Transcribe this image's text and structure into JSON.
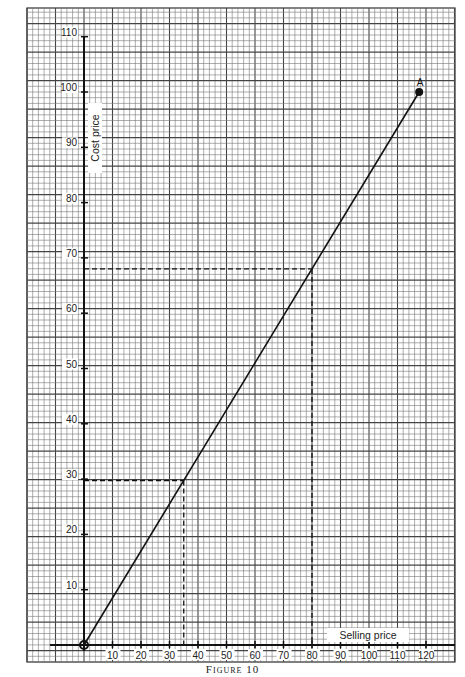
{
  "caption": "Figure 10",
  "chart_data": {
    "type": "line",
    "title": "",
    "xlabel": "Selling price",
    "ylabel": "Cost price",
    "xlim": [
      0,
      120
    ],
    "ylim": [
      0,
      110
    ],
    "x_ticks": [
      10,
      20,
      30,
      40,
      50,
      60,
      70,
      80,
      90,
      100,
      110,
      120
    ],
    "y_ticks": [
      10,
      20,
      30,
      40,
      50,
      60,
      70,
      80,
      90,
      100,
      110
    ],
    "grid": true,
    "series": [
      {
        "name": "Cost vs Selling price",
        "x": [
          0,
          117.6
        ],
        "y": [
          0,
          100
        ],
        "points": [
          {
            "label": "",
            "x": 0,
            "y": 0
          },
          {
            "label": "A",
            "x": 117.6,
            "y": 100
          }
        ]
      }
    ],
    "annotations": [
      {
        "type": "dashed-readoff",
        "x": 80,
        "y": 68
      },
      {
        "type": "dashed-readoff",
        "x": 35,
        "y": 29.75
      }
    ],
    "legend": null
  }
}
